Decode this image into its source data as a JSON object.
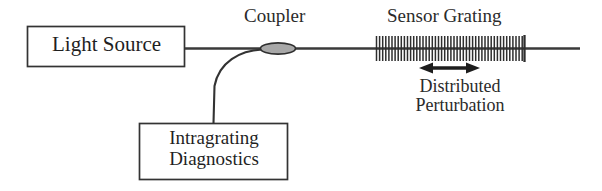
{
  "figure": {
    "type": "schematic-diagram",
    "background_color": "#ffffff",
    "line_color": "#333333",
    "text_color": "#2b2b2b",
    "coupler_fill_color": "#a8a8a8"
  },
  "blocks": {
    "light_source": {
      "label": "Light Source",
      "x": 27,
      "y": 26,
      "width": 158,
      "height": 41
    },
    "diagnostics": {
      "label_line1": "Intragrating",
      "label_line2": "Diagnostics",
      "x": 139,
      "y": 123,
      "width": 149,
      "height": 57
    }
  },
  "labels": {
    "coupler": "Coupler",
    "sensor_grating": "Sensor Grating",
    "perturbation_line1": "Distributed",
    "perturbation_line2": "Perturbation"
  },
  "elements": {
    "fiber_line": {
      "name": "optical-fiber",
      "y": 48,
      "x_start": 185,
      "x_end": 580
    },
    "coupler_ellipse": {
      "cx": 278,
      "cy": 48,
      "rx": 17,
      "ry": 5.5
    },
    "branch_fiber": {
      "description": "curved branch from coupler down to diagnostics box",
      "from_x": 258,
      "from_y": 49,
      "to_x": 213,
      "to_y": 123
    },
    "grating": {
      "x_start": 376,
      "x_end": 524,
      "line_count": 48,
      "tick_top": 36,
      "tick_bottom": 60
    },
    "perturbation_arrow": {
      "x_left": 421,
      "x_right": 478,
      "y": 68,
      "double_headed": true
    }
  }
}
